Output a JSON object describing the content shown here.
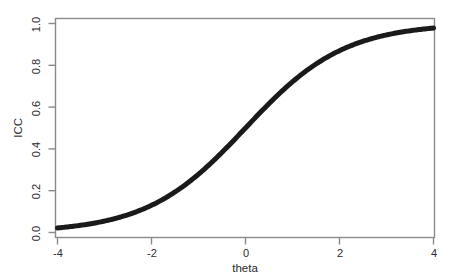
{
  "chart_data": {
    "type": "line",
    "title": "",
    "subtitle": "",
    "xlabel": "theta",
    "ylabel": "ICC",
    "xlim": [
      -4,
      4
    ],
    "ylim": [
      0,
      1
    ],
    "xticks": [
      -4,
      -2,
      0,
      2,
      4
    ],
    "xtick_labels": [
      "-4",
      "-2",
      "0",
      "2",
      "4"
    ],
    "yticks": [
      0.0,
      0.2,
      0.4,
      0.6,
      0.8,
      1.0
    ],
    "ytick_labels": [
      "0.0",
      "0.2",
      "0.4",
      "0.6",
      "0.8",
      "1.0"
    ],
    "grid": false,
    "legend": false,
    "legend_position": "none",
    "model": "2PL logistic item characteristic curve",
    "discrimination_a": 0.95,
    "difficulty_b": 0.0,
    "series": [
      {
        "name": "ICC",
        "color": "#1a1a1a",
        "line_width": 5,
        "x": [
          -4.0,
          -3.75,
          -3.5,
          -3.25,
          -3.0,
          -2.75,
          -2.5,
          -2.25,
          -2.0,
          -1.75,
          -1.5,
          -1.25,
          -1.0,
          -0.75,
          -0.5,
          -0.25,
          0.0,
          0.25,
          0.5,
          0.75,
          1.0,
          1.25,
          1.5,
          1.75,
          2.0,
          2.25,
          2.5,
          2.75,
          3.0,
          3.25,
          3.5,
          3.75,
          4.0
        ],
        "values": [
          0.022,
          0.028,
          0.035,
          0.044,
          0.055,
          0.069,
          0.086,
          0.108,
          0.13,
          0.16,
          0.19,
          0.23,
          0.28,
          0.33,
          0.38,
          0.44,
          0.5,
          0.56,
          0.62,
          0.67,
          0.72,
          0.77,
          0.81,
          0.84,
          0.87,
          0.89,
          0.91,
          0.93,
          0.945,
          0.956,
          0.965,
          0.972,
          0.978
        ]
      }
    ],
    "reference_points": [
      {
        "theta": -4,
        "icc": 0.02
      },
      {
        "theta": -2,
        "icc": 0.17
      },
      {
        "theta": 0,
        "icc": 0.5
      },
      {
        "theta": 2,
        "icc": 0.86
      },
      {
        "theta": 4,
        "icc": 0.98
      }
    ],
    "colors": {
      "curve": "#1a1a1a",
      "axis": "#808080",
      "background": "#ffffff",
      "text": "#2b2b2b"
    }
  }
}
